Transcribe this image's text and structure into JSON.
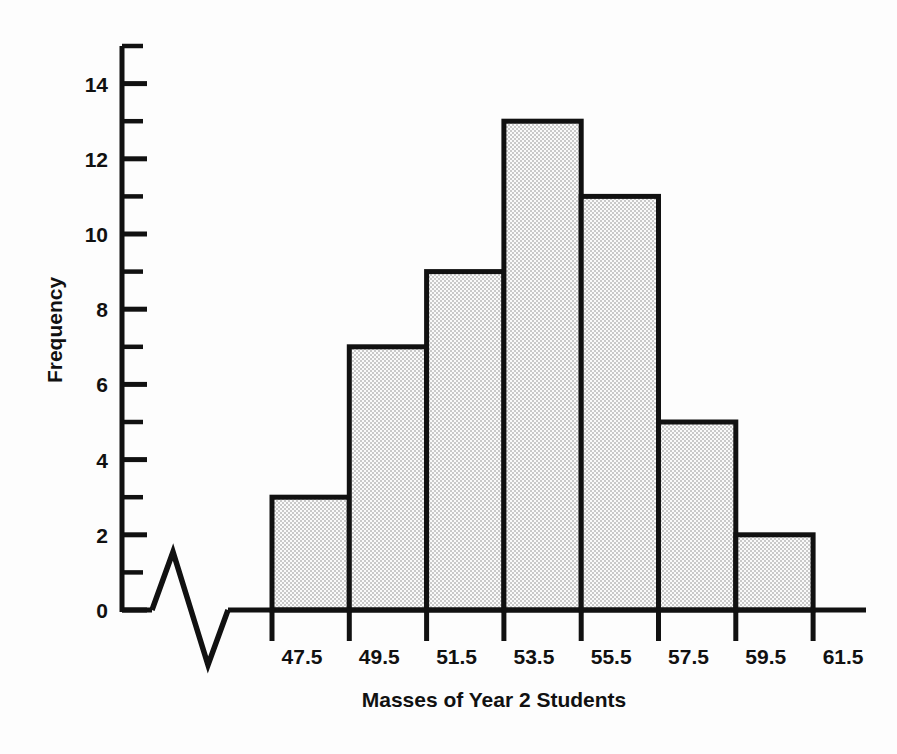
{
  "chart_data": {
    "type": "bar",
    "title": "",
    "subtitle": "",
    "xlabel": "Masses of Year 2 Students",
    "ylabel": "Frequency",
    "categories": [
      "47.5-49.5",
      "49.5-51.5",
      "51.5-53.5",
      "53.5-55.5",
      "55.5-57.5",
      "57.5-59.5",
      "59.5-61.5"
    ],
    "bin_edges": [
      47.5,
      49.5,
      51.5,
      53.5,
      55.5,
      57.5,
      59.5,
      61.5
    ],
    "values": [
      3,
      7,
      9,
      13,
      11,
      5,
      2
    ],
    "x_tick_labels": [
      "47.5",
      "49.5",
      "51.5",
      "53.5",
      "55.5",
      "57.5",
      "59.5",
      "61.5"
    ],
    "y_tick_labels": [
      "0",
      "2",
      "4",
      "6",
      "8",
      "10",
      "12",
      "14"
    ],
    "y_tick_values": [
      0,
      2,
      4,
      6,
      8,
      10,
      12,
      14
    ],
    "y_minor_tick_values": [
      1,
      3,
      5,
      7,
      9,
      11,
      13,
      15
    ],
    "ylim": [
      0,
      15
    ],
    "grid": false,
    "legend": "none",
    "bar_fill_color": "#e3e3e3",
    "bar_edge_color": "#111111",
    "axis_color": "#111111",
    "background_color": "#fdfdfd",
    "axis_break_symbol": "zigzag",
    "total_frequency": 50
  },
  "axes": {
    "y_title": "Frequency",
    "x_title": "Masses of Year 2 Students"
  }
}
